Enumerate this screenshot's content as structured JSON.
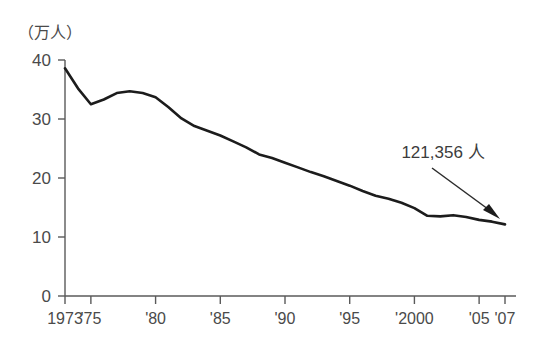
{
  "chart_data": {
    "type": "line",
    "title": "",
    "subtitle": "",
    "xlabel": "",
    "ylabel": "（万人）",
    "ylabel_note": "unit: ten thousand persons",
    "xlim": [
      1973,
      2007
    ],
    "ylim": [
      0,
      40
    ],
    "grid": false,
    "legend": false,
    "y_ticks": [
      "0",
      "10",
      "20",
      "30",
      "40"
    ],
    "y_tick_values": [
      0,
      10,
      20,
      30,
      40
    ],
    "x_tick_labels": [
      "1973",
      "'75",
      "'80",
      "'85",
      "'90",
      "'95",
      "'2000",
      "'05",
      "'07"
    ],
    "x_tick_values": [
      1973,
      1975,
      1980,
      1985,
      1990,
      1995,
      2000,
      2005,
      2007
    ],
    "series": [
      {
        "name": "",
        "x": [
          1973,
          1974,
          1975,
          1976,
          1977,
          1978,
          1979,
          1980,
          1981,
          1982,
          1983,
          1984,
          1985,
          1986,
          1987,
          1988,
          1989,
          1990,
          1991,
          1992,
          1993,
          1994,
          1995,
          1996,
          1997,
          1998,
          1999,
          2000,
          2001,
          2002,
          2003,
          2004,
          2005,
          2006,
          2007
        ],
        "values": [
          38.6,
          35.2,
          32.5,
          33.3,
          34.4,
          34.7,
          34.4,
          33.7,
          32.0,
          30.1,
          28.8,
          28.0,
          27.2,
          26.2,
          25.2,
          24.0,
          23.4,
          22.6,
          21.8,
          21.0,
          20.3,
          19.5,
          18.7,
          17.8,
          17.0,
          16.5,
          15.8,
          14.9,
          13.6,
          13.5,
          13.7,
          13.4,
          12.9,
          12.6,
          12.14
        ]
      }
    ],
    "annotations": [
      {
        "text": "121,356 人",
        "points_to_year": 2007,
        "points_to_value": 12.14
      }
    ]
  },
  "annotation": {
    "value_label": "121,356 人"
  },
  "axis": {
    "y_unit": "（万人）"
  }
}
